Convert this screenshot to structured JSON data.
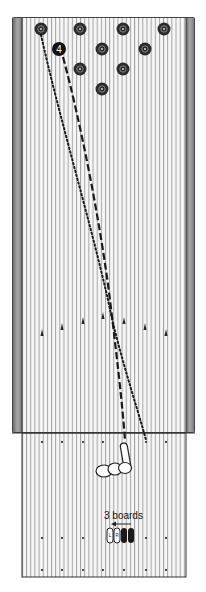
{
  "diagram": {
    "type": "bowling-lane-targeting",
    "pins": [
      {
        "id": 7,
        "x": 41,
        "y": 29
      },
      {
        "id": 8,
        "x": 80,
        "y": 29
      },
      {
        "id": 9,
        "x": 123,
        "y": 29
      },
      {
        "id": 10,
        "x": 164,
        "y": 29
      },
      {
        "id": 4,
        "x": 59,
        "y": 49,
        "highlighted": true,
        "label": "4"
      },
      {
        "id": 5,
        "x": 102,
        "y": 49
      },
      {
        "id": 6,
        "x": 145,
        "y": 49
      },
      {
        "id": 2,
        "x": 80,
        "y": 69
      },
      {
        "id": 3,
        "x": 123,
        "y": 69
      },
      {
        "id": 1,
        "x": 102,
        "y": 89
      }
    ],
    "arrows": [
      {
        "x": 42,
        "y": 334
      },
      {
        "x": 62,
        "y": 328
      },
      {
        "x": 83,
        "y": 322
      },
      {
        "x": 103,
        "y": 317
      },
      {
        "x": 124,
        "y": 322
      },
      {
        "x": 145,
        "y": 328
      },
      {
        "x": 166,
        "y": 334
      }
    ],
    "approach_dots_rows": [
      442,
      538,
      570
    ],
    "approach_dots_x": [
      42,
      62,
      83,
      103,
      124,
      145,
      166
    ],
    "footwork_label": "3 boards",
    "shoe_labels": [
      "L",
      "R"
    ],
    "paths": [
      {
        "name": "ball-path-dashed",
        "style": "dashed"
      },
      {
        "name": "ball-path-dotted",
        "style": "dotted"
      }
    ],
    "colors": {
      "gutter": "#8a8a8a",
      "board_line": "#9a9a9a",
      "pin_fill": "#2b2b2b",
      "lane_bg": "#f4f4f4"
    }
  }
}
